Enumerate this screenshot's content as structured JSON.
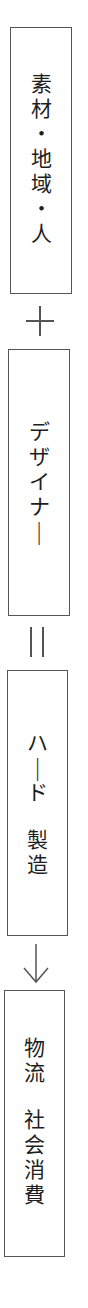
{
  "diagram": {
    "orientation": "vertical",
    "boxes": [
      {
        "id": "materials-region-people",
        "label": "素材・地域・人",
        "lines": [
          "素材・地域・人"
        ]
      },
      {
        "id": "designer",
        "label": "デザイナー",
        "lines": [
          "デザイナー"
        ]
      },
      {
        "id": "hardware-manufacturing",
        "label": "ハード 製造",
        "lines": [
          "ハード",
          "製造"
        ]
      },
      {
        "id": "logistics-social-consumption",
        "label": "物流 社会消費",
        "lines": [
          "物流",
          "社会消費"
        ]
      }
    ],
    "connectors": [
      {
        "between": [
          0,
          1
        ],
        "symbol": "plus",
        "glyph": "+"
      },
      {
        "between": [
          1,
          2
        ],
        "symbol": "equals",
        "glyph": "＝"
      },
      {
        "between": [
          2,
          3
        ],
        "symbol": "arrow-down",
        "glyph": "↓"
      }
    ],
    "colors": {
      "border": "#555555",
      "text": "#1e1e1e",
      "background": "#ffffff"
    }
  }
}
